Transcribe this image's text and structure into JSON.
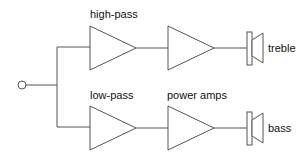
{
  "diagram": {
    "title": "",
    "labels": {
      "high_pass": "high-pass",
      "low_pass": "low-pass",
      "power_amps": "power amps",
      "treble": "treble",
      "bass": "bass"
    },
    "nodes": [
      {
        "id": "input",
        "type": "terminal-circle"
      },
      {
        "id": "hp-filter",
        "type": "amplifier-triangle",
        "label": "high-pass"
      },
      {
        "id": "treble-amp",
        "type": "amplifier-triangle"
      },
      {
        "id": "treble-speaker",
        "type": "speaker",
        "label": "treble"
      },
      {
        "id": "lp-filter",
        "type": "amplifier-triangle",
        "label": "low-pass"
      },
      {
        "id": "bass-amp",
        "type": "amplifier-triangle",
        "label": "power amps"
      },
      {
        "id": "bass-speaker",
        "type": "speaker",
        "label": "bass"
      }
    ],
    "edges": [
      [
        "input",
        "hp-filter"
      ],
      [
        "hp-filter",
        "treble-amp"
      ],
      [
        "treble-amp",
        "treble-speaker"
      ],
      [
        "input",
        "lp-filter"
      ],
      [
        "lp-filter",
        "bass-amp"
      ],
      [
        "bass-amp",
        "bass-speaker"
      ]
    ]
  }
}
